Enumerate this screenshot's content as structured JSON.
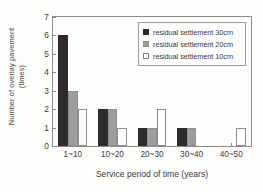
{
  "chart_data": {
    "type": "bar",
    "title": "",
    "xlabel": "Service period of time (years)",
    "ylabel_line1": "Number of overlay pavement",
    "ylabel_line2": "(times)",
    "ylabel": "Number of overlay pavement (times)",
    "categories": [
      "1~10",
      "10~20",
      "20~30",
      "30~40",
      "40~50"
    ],
    "series": [
      {
        "name": "residual settlement 30cm",
        "color": "#2b2b2b",
        "values": [
          6,
          2,
          1,
          1,
          0
        ]
      },
      {
        "name": "residual settlement 20cm",
        "color": "#9d9d9d",
        "values": [
          3,
          2,
          1,
          1,
          0
        ]
      },
      {
        "name": "residual settlement 10cm",
        "color": "#ffffff",
        "values": [
          2,
          1,
          2,
          0,
          1
        ]
      }
    ],
    "ylim": [
      0,
      7
    ],
    "yticks": [
      0,
      1,
      2,
      3,
      4,
      5,
      6,
      7
    ],
    "ytick_labels": [
      "0",
      "1",
      "2",
      "3",
      "4",
      "5",
      "6",
      "7"
    ],
    "grid": false,
    "legend_position": "top-right"
  }
}
